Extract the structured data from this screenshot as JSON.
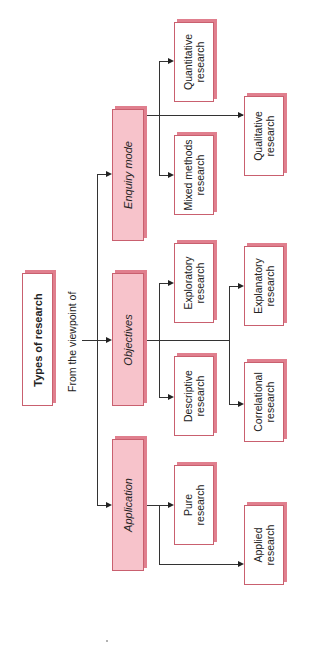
{
  "title": "Types of research",
  "subtitle": "From the viewpoint of",
  "categories": [
    {
      "label": "Enquiry mode",
      "children": [
        "Quantitative research",
        "Mixed methods research",
        "Qualitative research"
      ]
    },
    {
      "label": "Objectives",
      "children": [
        "Exploratory research",
        "Descriptive research",
        "Explanatory research",
        "Correlational research"
      ]
    },
    {
      "label": "Application",
      "children": [
        "Pure research",
        "Applied research"
      ]
    }
  ],
  "nodes": {
    "quantitative": [
      "Quantitative",
      "research"
    ],
    "mixed": [
      "Mixed methods",
      "research"
    ],
    "qualitative": [
      "Qualitative",
      "research"
    ],
    "exploratory": [
      "Exploratory",
      "research"
    ],
    "descriptive": [
      "Descriptive",
      "research"
    ],
    "explanatory": [
      "Explanatory",
      "research"
    ],
    "correlational": [
      "Correlational",
      "research"
    ],
    "pure": [
      "Pure",
      "research"
    ],
    "applied": [
      "Applied",
      "research"
    ]
  },
  "colors": {
    "category_fill": "#f7c3cb",
    "shadow": "#e07f8e",
    "border": "#c9606f"
  }
}
